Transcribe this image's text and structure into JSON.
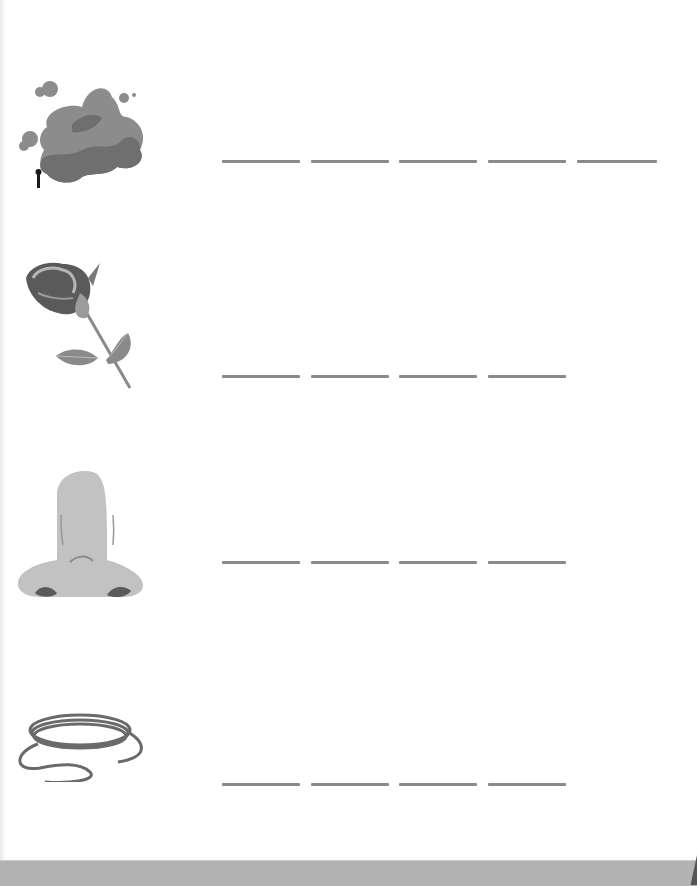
{
  "worksheet": {
    "rows": [
      {
        "picture": "smoke-icon",
        "top": 160,
        "blanks": [
          [
            222,
            78
          ],
          [
            311,
            78
          ],
          [
            399,
            78
          ],
          [
            488,
            78
          ],
          [
            577,
            80
          ]
        ]
      },
      {
        "picture": "rose-icon",
        "top": 375,
        "blanks": [
          [
            222,
            78
          ],
          [
            311,
            78
          ],
          [
            399,
            78
          ],
          [
            488,
            78
          ]
        ]
      },
      {
        "picture": "nose-icon",
        "top": 561,
        "blanks": [
          [
            222,
            78
          ],
          [
            311,
            78
          ],
          [
            399,
            78
          ],
          [
            488,
            78
          ]
        ]
      },
      {
        "picture": "rope-icon",
        "top": 783,
        "blanks": [
          [
            222,
            78
          ],
          [
            311,
            78
          ],
          [
            399,
            78
          ],
          [
            488,
            78
          ]
        ]
      }
    ]
  },
  "colors": {
    "blank_line": "#8a8a8a",
    "bottom_bar": "#b3b3b3"
  }
}
